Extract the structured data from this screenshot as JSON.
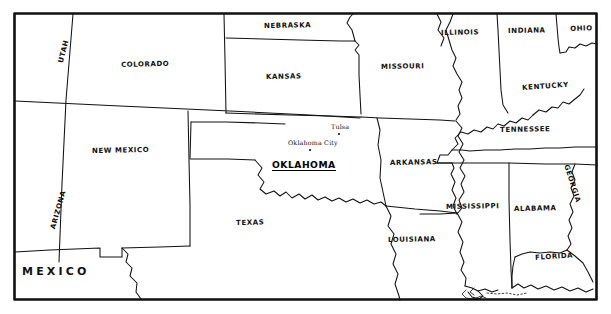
{
  "map": {
    "title": "South Central United States reference map",
    "style": "hand-drawn black and white outline map",
    "background_color": "#ffffff",
    "line_color": "#111111",
    "frame": {
      "name": "map-border-frame",
      "x": 14,
      "y": 13,
      "width": 583,
      "height": 287,
      "stroke_width": 2.4
    },
    "highlighted_state": {
      "name": "Oklahoma",
      "label": "OKLAHOMA",
      "style": "bold underlined",
      "x": 272,
      "y": 160
    },
    "states": [
      {
        "id": "utah",
        "label": "UTAH",
        "x": 58,
        "y": 62,
        "rotate": -76,
        "size": "normal"
      },
      {
        "id": "colorado",
        "label": "COLORADO",
        "x": 121,
        "y": 62,
        "rotate": -1.5,
        "size": "normal"
      },
      {
        "id": "nebraska",
        "label": "NEBRASKA",
        "x": 286,
        "y": 23,
        "rotate": -1,
        "size": "normal"
      },
      {
        "id": "kansas",
        "label": "KANSAS",
        "x": 284,
        "y": 74,
        "rotate": -1,
        "size": "normal"
      },
      {
        "id": "missouri",
        "label": "MISSOURI",
        "x": 398,
        "y": 64,
        "rotate": -1,
        "size": "normal"
      },
      {
        "id": "illinois",
        "label": "ILLINOIS",
        "x": 453,
        "y": 30,
        "rotate": -1,
        "size": "normal"
      },
      {
        "id": "indiana",
        "label": "INDIANA",
        "x": 513,
        "y": 28,
        "rotate": -1,
        "size": "normal"
      },
      {
        "id": "ohio",
        "label": "OHIO",
        "x": 572,
        "y": 26,
        "rotate": -2,
        "size": "normal"
      },
      {
        "id": "kentucky",
        "label": "KENTUCKY",
        "x": 524,
        "y": 85,
        "rotate": -4,
        "size": "normal"
      },
      {
        "id": "tennessee",
        "label": "TENNESSEE",
        "x": 503,
        "y": 127,
        "rotate": -1,
        "size": "normal"
      },
      {
        "id": "arkansas",
        "label": "ARKANSAS",
        "x": 390,
        "y": 160,
        "rotate": -1,
        "size": "normal"
      },
      {
        "id": "new-mexico",
        "label": "NEW MEXICO",
        "x": 92,
        "y": 148,
        "rotate": -1,
        "size": "normal"
      },
      {
        "id": "arizona",
        "label": "ARIZONA",
        "x": 50,
        "y": 228,
        "rotate": -74,
        "size": "normal"
      },
      {
        "id": "texas",
        "label": "TEXAS",
        "x": 236,
        "y": 220,
        "rotate": -1,
        "size": "normal"
      },
      {
        "id": "louisiana",
        "label": "LOUISIANA",
        "x": 390,
        "y": 237,
        "rotate": -1,
        "size": "normal"
      },
      {
        "id": "mississippi",
        "label": "MISSISSIPPI",
        "x": 447,
        "y": 204,
        "rotate": -1,
        "size": "normal"
      },
      {
        "id": "alabama",
        "label": "ALABAMA",
        "x": 514,
        "y": 206,
        "rotate": -1,
        "size": "normal"
      },
      {
        "id": "georgia",
        "label": "GEORGIA",
        "x": 569,
        "y": 164,
        "rotate": 72,
        "size": "normal"
      },
      {
        "id": "florida",
        "label": "FLORIDA",
        "x": 535,
        "y": 255,
        "rotate": -4,
        "size": "normal"
      }
    ],
    "countries": [
      {
        "id": "mexico",
        "label": "MEXICO",
        "x": 22,
        "y": 266
      }
    ],
    "cities": [
      {
        "id": "tulsa",
        "label": "Tulsa",
        "label_x": 331,
        "label_y": 124,
        "dot_x": 338,
        "dot_y": 133
      },
      {
        "id": "oklahoma-city",
        "label": "Oklahoma City",
        "label_x": 288,
        "label_y": 140,
        "dot_x": 309,
        "dot_y": 149
      }
    ]
  }
}
